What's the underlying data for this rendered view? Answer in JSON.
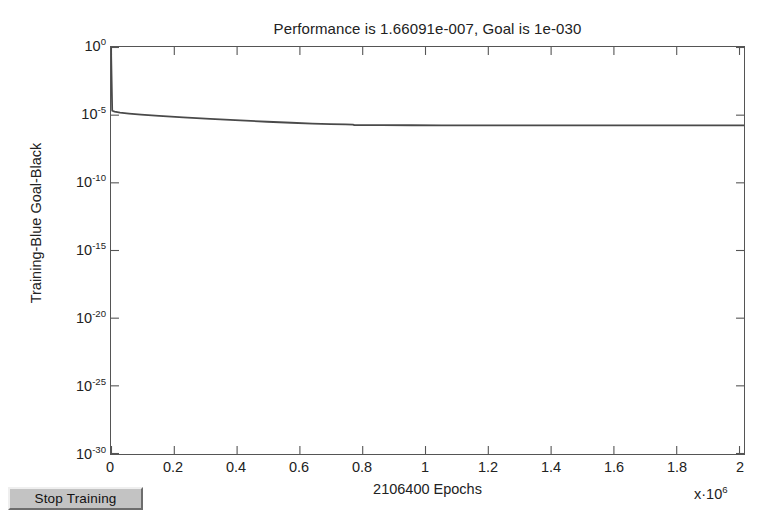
{
  "window": {
    "background_color": "#ffffff"
  },
  "title": "Performance is 1.66091e-007, Goal is 1e-030",
  "axis_labels": {
    "y": "Training-Blue Goal-Black",
    "x": "2106400 Epochs",
    "x_multiplier_prefix": "x·10",
    "x_multiplier_exponent": "6"
  },
  "controls": {
    "stop_training_label": "Stop Training"
  },
  "ytick_labels": [
    {
      "mantissa": "10",
      "exponent": "0"
    },
    {
      "mantissa": "10",
      "exponent": "-5"
    },
    {
      "mantissa": "10",
      "exponent": "-10"
    },
    {
      "mantissa": "10",
      "exponent": "-15"
    },
    {
      "mantissa": "10",
      "exponent": "-20"
    },
    {
      "mantissa": "10",
      "exponent": "-25"
    },
    {
      "mantissa": "10",
      "exponent": "-30"
    }
  ],
  "xtick_labels": [
    "0",
    "0.2",
    "0.4",
    "0.6",
    "0.8",
    "1",
    "1.2",
    "1.4",
    "1.6",
    "1.8",
    "2"
  ],
  "colors": {
    "axis": "#555555",
    "curve": "#4a4a4a",
    "text": "#222222",
    "button_face": "#c3c3c3"
  },
  "chart_data": {
    "type": "line",
    "title": "Performance is 1.66091e-007, Goal is 1e-030",
    "xlabel": "2106400 Epochs",
    "ylabel": "Training-Blue Goal-Black",
    "x_multiplier": 1000000,
    "xlim": [
      0,
      2.1064
    ],
    "ylim": [
      1e-30,
      1
    ],
    "yscale": "log",
    "xscale": "linear",
    "grid": false,
    "legend": null,
    "xticks": [
      0,
      0.2,
      0.4,
      0.6,
      0.8,
      1.0,
      1.2,
      1.4,
      1.6,
      1.8,
      2.0
    ],
    "yticks": [
      1.0,
      1e-05,
      1e-10,
      1e-15,
      1e-20,
      1e-25,
      1e-30
    ],
    "annotations": {
      "final_performance": 1.66091e-07,
      "goal": 1e-30,
      "epochs": 2106400
    },
    "series": [
      {
        "name": "Training",
        "color": "#4a4a4a",
        "x": [
          0.0,
          0.004,
          0.012,
          0.03,
          0.06,
          0.1,
          0.16,
          0.24,
          0.33,
          0.43,
          0.52,
          0.6,
          0.67,
          0.73,
          0.78,
          0.805,
          0.81,
          0.9,
          1.0,
          1.1,
          1.2,
          1.24,
          1.245,
          1.35,
          1.5,
          1.65,
          1.8,
          1.95,
          2.1064
        ],
        "y": [
          1.0,
          2e-05,
          1.7e-05,
          1.45e-05,
          1.25e-05,
          1.05e-05,
          8.5e-06,
          6.6e-06,
          5.1e-06,
          3.9e-06,
          3.1e-06,
          2.6e-06,
          2.25e-06,
          2.05e-06,
          1.95e-06,
          1.92e-06,
          1.75e-06,
          1.73e-06,
          1.71e-06,
          1.7e-06,
          1.69e-06,
          1.685e-06,
          1.67e-06,
          1.668e-06,
          1.667e-06,
          1.666e-06,
          1.6655e-06,
          1.665e-06,
          1.66091e-06
        ]
      }
    ]
  }
}
